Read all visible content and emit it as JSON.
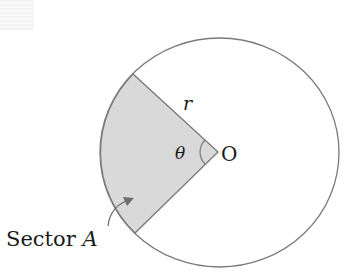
{
  "diagram": {
    "labels": {
      "radius": "r",
      "angle": "θ",
      "center": "O",
      "sector_prefix": "Sector ",
      "sector_name": "A"
    },
    "colors": {
      "stroke": "#7a7a7a",
      "sector_fill": "#d9d9d9",
      "text": "#1a1a1a",
      "arrow": "#6e6e6e"
    }
  }
}
